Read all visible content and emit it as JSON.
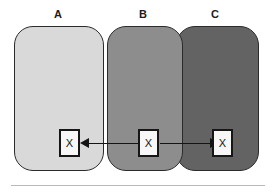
{
  "diagram": {
    "title": "",
    "regions": [
      {
        "id": "a",
        "label": "A",
        "fill": "#d9d9d9",
        "stroke": "#2b2b2b"
      },
      {
        "id": "b",
        "label": "B",
        "fill": "#8d8d8d",
        "stroke": "#2b2b2b"
      },
      {
        "id": "c",
        "label": "C",
        "fill": "#636363",
        "stroke": "#2b2b2b"
      }
    ],
    "markers": [
      {
        "id": "a",
        "text": "X",
        "in_region": "A"
      },
      {
        "id": "b",
        "text": "X",
        "in_region": "B"
      },
      {
        "id": "c",
        "text": "X",
        "in_region": "C"
      }
    ],
    "arrows": [
      {
        "id": "left",
        "from": "B",
        "to": "A",
        "direction": "left"
      },
      {
        "id": "right",
        "from": "B",
        "to": "C",
        "direction": "right"
      }
    ],
    "divider": {
      "color": "#b9b9b9"
    },
    "background": "#ffffff"
  }
}
